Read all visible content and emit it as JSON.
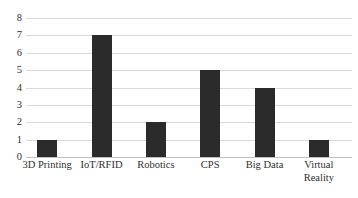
{
  "chart_data": {
    "type": "bar",
    "title": "",
    "subtitle": "",
    "xlabel": "",
    "ylabel": "",
    "categories": [
      "3D Printing",
      "IoT/RFID",
      "Robotics",
      "CPS",
      "Big Data",
      "Virtual Reality"
    ],
    "values": [
      1,
      7,
      2,
      5,
      4,
      1
    ],
    "ylim": [
      0,
      8
    ],
    "ytick_labels": [
      "0",
      "1",
      "2",
      "3",
      "4",
      "5",
      "6",
      "7",
      "8"
    ],
    "ytick_values": [
      0,
      1,
      2,
      3,
      4,
      5,
      6,
      7,
      8
    ],
    "grid": true,
    "grid_orientation": "horizontal",
    "legend": false,
    "legend_position": "none",
    "bar_color": "#2b2b2b",
    "gridline_color": "#d9d9d9",
    "background_color": "#ffffff",
    "axis_label_color": "#2f2f2f"
  },
  "axis": {
    "y_ticks": [
      {
        "label": "8",
        "value": 8
      },
      {
        "label": "7",
        "value": 7
      },
      {
        "label": "6",
        "value": 6
      },
      {
        "label": "5",
        "value": 5
      },
      {
        "label": "4",
        "value": 4
      },
      {
        "label": "3",
        "value": 3
      },
      {
        "label": "2",
        "value": 2
      },
      {
        "label": "1",
        "value": 1
      },
      {
        "label": "0",
        "value": 0
      }
    ],
    "x_categories": [
      {
        "label": "3D Printing",
        "value": 1
      },
      {
        "label": "IoT/RFID",
        "value": 7
      },
      {
        "label": "Robotics",
        "value": 2
      },
      {
        "label": "CPS",
        "value": 5
      },
      {
        "label": "Big Data",
        "value": 4
      },
      {
        "label": "Virtual\nReality",
        "value": 1
      }
    ]
  }
}
